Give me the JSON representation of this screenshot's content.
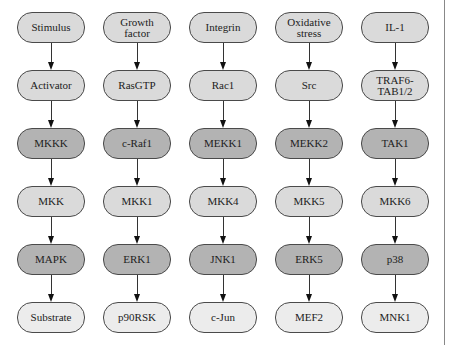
{
  "diagram": {
    "column_headers": [
      "General",
      "ERK1 pathway",
      "JNK1 pathway",
      "ERK5 pathway",
      "p38 pathway"
    ],
    "colors": {
      "light": "#dadada",
      "dark": "#b3b3b3",
      "pale": "#ececec",
      "border": "#4a4a4a",
      "arrow": "#111111"
    },
    "row_shades": [
      "light",
      "light",
      "dark",
      "light",
      "dark",
      "pale"
    ],
    "columns": [
      {
        "nodes": [
          "Stimulus",
          "Activator",
          "MKKK",
          "MKK",
          "MAPK",
          "Substrate"
        ]
      },
      {
        "nodes": [
          "Growth\nfactor",
          "RasGTP",
          "c-Raf1",
          "MKK1",
          "ERK1",
          "p90RSK"
        ]
      },
      {
        "nodes": [
          "Integrin",
          "Rac1",
          "MEKK1",
          "MKK4",
          "JNK1",
          "c-Jun"
        ]
      },
      {
        "nodes": [
          "Oxidative\nstress",
          "Src",
          "MEKK2",
          "MKK5",
          "ERK5",
          "MEF2"
        ]
      },
      {
        "nodes": [
          "IL-1",
          "TRAF6-\nTAB1/2",
          "TAK1",
          "MKK6",
          "p38",
          "MNK1"
        ]
      }
    ]
  }
}
